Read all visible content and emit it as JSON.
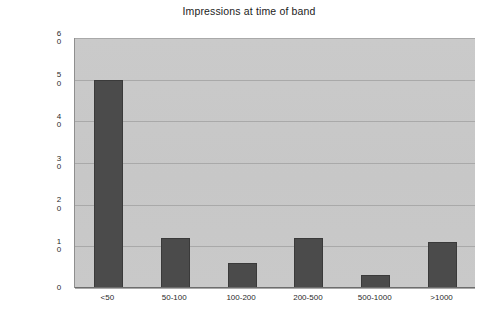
{
  "chart_data": {
    "type": "bar",
    "title": "Impressions at time of band",
    "xlabel": "",
    "ylabel": "Cylinder bands",
    "categories": [
      "<50",
      "50-100",
      "100-200",
      "200-500",
      "500-1000",
      ">1000"
    ],
    "values": [
      50,
      12,
      6,
      12,
      3,
      11
    ],
    "series": [
      {
        "name": "Cylinder bands",
        "values": [
          50,
          12,
          6,
          12,
          3,
          11
        ]
      }
    ],
    "ylim": [
      0,
      60
    ],
    "ytick_values": [
      60,
      50,
      40,
      30,
      20,
      10,
      0
    ],
    "ytick_labels": [
      "60",
      "50",
      "40",
      "30",
      "20",
      "10",
      "0"
    ],
    "grid": true,
    "grid_axis": "y",
    "legend": false,
    "legend_position": "none",
    "colors": {
      "bar_fill": "#4b4b4b",
      "bar_border": "#3a3a3a",
      "plot_background": "#c9c9c9",
      "gridline": "#a9a9a9",
      "axis_line": "#6d6d6d",
      "text": "#1c1c1c",
      "figure_background": "#ffffff"
    }
  }
}
